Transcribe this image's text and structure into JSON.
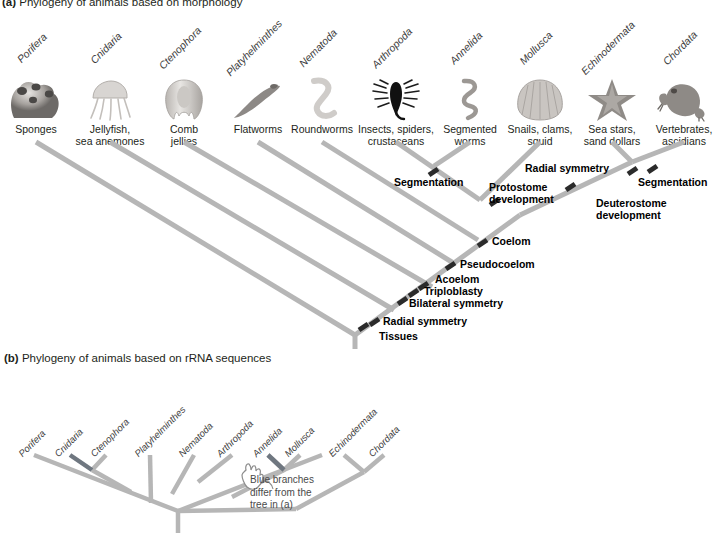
{
  "figure": {
    "panel_a": {
      "label": "(a)",
      "caption": "Phylogeny of animals based on morphology"
    },
    "panel_b": {
      "label": "(b)",
      "caption": "Phylogeny of animals based on rRNA sequences",
      "note": "Blue branches\ndiffer from the\ntree in (a)",
      "note_line1": "Blue branches",
      "note_line2": "differ from the",
      "note_line3": "tree in (a)"
    },
    "colors": {
      "branch": "#b6b6b6",
      "branch_highlight": "#6f7780",
      "text": "#231f20",
      "sci_name": "#3d3d3d",
      "tick": "#2b2b2b",
      "background": "#ffffff"
    },
    "taxa": [
      {
        "scientific": "Porifera",
        "common": "Sponges",
        "icon": "sponge-icon"
      },
      {
        "scientific": "Cnidaria",
        "common": "Jellyfish,\nsea anemones",
        "common_line1": "Jellyfish,",
        "common_line2": "sea anemones",
        "icon": "jellyfish-icon"
      },
      {
        "scientific": "Ctenophora",
        "common": "Comb\njellies",
        "common_line1": "Comb",
        "common_line2": "jellies",
        "icon": "comb-jelly-icon"
      },
      {
        "scientific": "Platyhelminthes",
        "common": "Flatworms",
        "icon": "flatworm-icon"
      },
      {
        "scientific": "Nematoda",
        "common": "Roundworms",
        "icon": "roundworm-icon"
      },
      {
        "scientific": "Arthropoda",
        "common": "Insects, spiders,\ncrustaceans",
        "common_line1": "Insects, spiders,",
        "common_line2": "crustaceans",
        "icon": "scorpion-icon"
      },
      {
        "scientific": "Annelida",
        "common": "Segmented\nworms",
        "common_line1": "Segmented",
        "common_line2": "worms",
        "icon": "segmented-worm-icon"
      },
      {
        "scientific": "Mollusca",
        "common": "Snails, clams,\nsquid",
        "common_line1": "Snails, clams,",
        "common_line2": "squid",
        "icon": "scallop-shell-icon"
      },
      {
        "scientific": "Echinodermata",
        "common": "Sea stars,\nsand dollars",
        "common_line1": "Sea stars,",
        "common_line2": "sand dollars",
        "icon": "sea-star-icon"
      },
      {
        "scientific": "Chordata",
        "common": "Vertebrates,\nascidians",
        "common_line1": "Vertebrates,",
        "common_line2": "ascidians",
        "icon": "frog-icon"
      }
    ],
    "traits": [
      {
        "name": "Tissues",
        "id": "trait-tissues"
      },
      {
        "name": "Radial symmetry",
        "id": "trait-radial-symmetry-basal"
      },
      {
        "name": "Bilateral symmetry",
        "id": "trait-bilateral-symmetry"
      },
      {
        "name": "Triploblasty",
        "id": "trait-triploblasty"
      },
      {
        "name": "Acoelom",
        "id": "trait-acoelom"
      },
      {
        "name": "Pseudocoelom",
        "id": "trait-pseudocoelom"
      },
      {
        "name": "Coelom",
        "id": "trait-coelom"
      },
      {
        "name": "Segmentation",
        "id": "trait-segmentation-arthropoda"
      },
      {
        "name": "Protostome\ndevelopment",
        "line1": "Protostome",
        "line2": "development",
        "id": "trait-protostome-development"
      },
      {
        "name": "Deuterostome\ndevelopment",
        "line1": "Deuterostome",
        "line2": "development",
        "id": "trait-deuterostome-development"
      },
      {
        "name": "Radial symmetry",
        "id": "trait-radial-symmetry-echinodermata"
      },
      {
        "name": "Segmentation",
        "id": "trait-segmentation-chordata"
      }
    ],
    "panel_b_taxa": [
      "Porifera",
      "Cnidaria",
      "Ctenophora",
      "Platyhelminthes",
      "Nematoda",
      "Arthropoda",
      "Annelida",
      "Mollusca",
      "Echinodermata",
      "Chordata"
    ]
  }
}
